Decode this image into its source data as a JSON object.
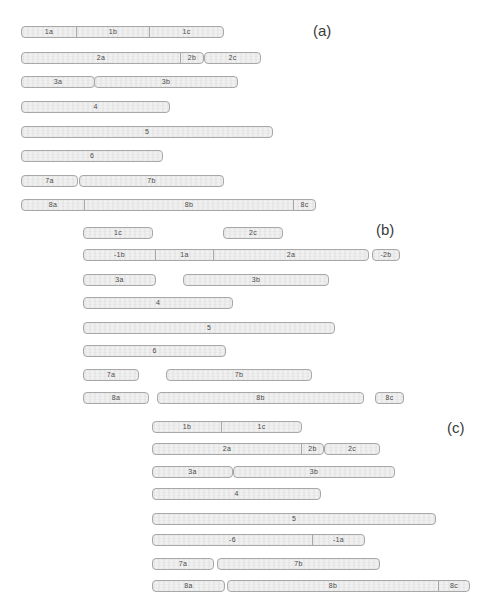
{
  "figure": {
    "background": "#ffffff",
    "bar_fill": "#f0f0f0",
    "bar_border": "#a8a8a8",
    "segment_label_color": "#4a4a4a",
    "group_label_color": "#3a3a3a"
  },
  "groups": [
    {
      "id": "a",
      "label": "(a)",
      "label_pos": {
        "x": 313,
        "y": 22
      },
      "rows": [
        {
          "y": 26,
          "bars": [
            {
              "x": 21,
              "segments": [
                {
                  "label": "1a",
                  "w": 54
                },
                {
                  "label": "1b",
                  "w": 73
                },
                {
                  "label": "1c",
                  "w": 74
                }
              ]
            }
          ]
        },
        {
          "y": 52,
          "bars": [
            {
              "x": 21,
              "segments": [
                {
                  "label": "2a",
                  "w": 158
                },
                {
                  "label": "2b",
                  "w": 23
                }
              ]
            },
            {
              "x": 204,
              "segments": [
                {
                  "label": "2c",
                  "w": 55
                }
              ]
            }
          ]
        },
        {
          "y": 76,
          "bars": [
            {
              "x": 21,
              "segments": [
                {
                  "label": "3a",
                  "w": 72
                }
              ]
            },
            {
              "x": 94,
              "segments": [
                {
                  "label": "3b",
                  "w": 142
                }
              ]
            }
          ]
        },
        {
          "y": 101,
          "bars": [
            {
              "x": 21,
              "segments": [
                {
                  "label": "4",
                  "w": 147
                }
              ]
            }
          ]
        },
        {
          "y": 126,
          "bars": [
            {
              "x": 21,
              "segments": [
                {
                  "label": "5",
                  "w": 250
                }
              ]
            }
          ]
        },
        {
          "y": 150,
          "bars": [
            {
              "x": 21,
              "segments": [
                {
                  "label": "6",
                  "w": 140
                }
              ]
            }
          ]
        },
        {
          "y": 175,
          "bars": [
            {
              "x": 21,
              "segments": [
                {
                  "label": "7a",
                  "w": 55
                }
              ]
            },
            {
              "x": 79,
              "segments": [
                {
                  "label": "7b",
                  "w": 143
                }
              ]
            }
          ]
        },
        {
          "y": 199,
          "bars": [
            {
              "x": 21,
              "segments": [
                {
                  "label": "8a",
                  "w": 62
                },
                {
                  "label": "8b",
                  "w": 209
                },
                {
                  "label": "8c",
                  "w": 22
                }
              ]
            }
          ]
        }
      ]
    },
    {
      "id": "b",
      "label": "(b)",
      "label_pos": {
        "x": 376,
        "y": 221
      },
      "rows": [
        {
          "y": 227,
          "bars": [
            {
              "x": 83,
              "segments": [
                {
                  "label": "1c",
                  "w": 68
                }
              ]
            },
            {
              "x": 223,
              "segments": [
                {
                  "label": "2c",
                  "w": 58
                }
              ]
            }
          ]
        },
        {
          "y": 249,
          "bars": [
            {
              "x": 83,
              "segments": [
                {
                  "label": "-1b",
                  "w": 71
                },
                {
                  "label": "1a",
                  "w": 58
                },
                {
                  "label": "2a",
                  "w": 155
                }
              ]
            },
            {
              "x": 372,
              "segments": [
                {
                  "label": "-2b",
                  "w": 26
                }
              ]
            }
          ]
        },
        {
          "y": 274,
          "bars": [
            {
              "x": 83,
              "segments": [
                {
                  "label": "3a",
                  "w": 71
                }
              ]
            },
            {
              "x": 183,
              "segments": [
                {
                  "label": "3b",
                  "w": 144
                }
              ]
            }
          ]
        },
        {
          "y": 297,
          "bars": [
            {
              "x": 83,
              "segments": [
                {
                  "label": "4",
                  "w": 148
                }
              ]
            }
          ]
        },
        {
          "y": 322,
          "bars": [
            {
              "x": 83,
              "segments": [
                {
                  "label": "5",
                  "w": 250
                }
              ]
            }
          ]
        },
        {
          "y": 345,
          "bars": [
            {
              "x": 83,
              "segments": [
                {
                  "label": "6",
                  "w": 141
                }
              ]
            }
          ]
        },
        {
          "y": 369,
          "bars": [
            {
              "x": 83,
              "segments": [
                {
                  "label": "7a",
                  "w": 54
                }
              ]
            },
            {
              "x": 166,
              "segments": [
                {
                  "label": "7b",
                  "w": 144
                }
              ]
            }
          ]
        },
        {
          "y": 392,
          "bars": [
            {
              "x": 83,
              "segments": [
                {
                  "label": "8a",
                  "w": 64
                }
              ]
            },
            {
              "x": 157,
              "segments": [
                {
                  "label": "8b",
                  "w": 205
                }
              ]
            },
            {
              "x": 375,
              "segments": [
                {
                  "label": "8c",
                  "w": 27
                }
              ]
            }
          ]
        }
      ]
    },
    {
      "id": "c",
      "label": "(c)",
      "label_pos": {
        "x": 447,
        "y": 419
      },
      "rows": [
        {
          "y": 421,
          "bars": [
            {
              "x": 152,
              "segments": [
                {
                  "label": "1b",
                  "w": 68
                },
                {
                  "label": "1c",
                  "w": 80
                }
              ]
            }
          ]
        },
        {
          "y": 443,
          "bars": [
            {
              "x": 152,
              "segments": [
                {
                  "label": "2a",
                  "w": 148
                },
                {
                  "label": "2b",
                  "w": 22
                }
              ]
            },
            {
              "x": 324,
              "segments": [
                {
                  "label": "2c",
                  "w": 54
                }
              ]
            }
          ]
        },
        {
          "y": 466,
          "bars": [
            {
              "x": 152,
              "segments": [
                {
                  "label": "3a",
                  "w": 79
                }
              ]
            },
            {
              "x": 233,
              "segments": [
                {
                  "label": "3b",
                  "w": 160
                }
              ]
            }
          ]
        },
        {
          "y": 488,
          "bars": [
            {
              "x": 152,
              "segments": [
                {
                  "label": "4",
                  "w": 167
                }
              ]
            }
          ]
        },
        {
          "y": 513,
          "bars": [
            {
              "x": 152,
              "segments": [
                {
                  "label": "5",
                  "w": 282
                }
              ]
            }
          ]
        },
        {
          "y": 534,
          "bars": [
            {
              "x": 152,
              "segments": [
                {
                  "label": "-6",
                  "w": 159
                },
                {
                  "label": "-1a",
                  "w": 52
                }
              ]
            }
          ]
        },
        {
          "y": 558,
          "bars": [
            {
              "x": 152,
              "segments": [
                {
                  "label": "7a",
                  "w": 60
                }
              ]
            },
            {
              "x": 217,
              "segments": [
                {
                  "label": "7b",
                  "w": 161
                }
              ]
            }
          ]
        },
        {
          "y": 580,
          "bars": [
            {
              "x": 152,
              "segments": [
                {
                  "label": "8a",
                  "w": 71
                }
              ]
            },
            {
              "x": 227,
              "segments": [
                {
                  "label": "8b",
                  "w": 210
                },
                {
                  "label": "8c",
                  "w": 31
                }
              ]
            }
          ]
        }
      ]
    }
  ]
}
